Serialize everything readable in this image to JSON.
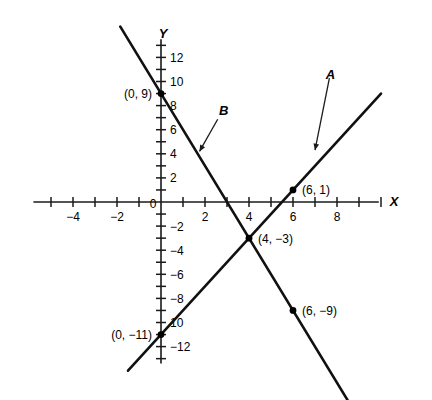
{
  "chart_data": {
    "type": "line",
    "title": "",
    "xlabel": "X",
    "ylabel": "Y",
    "xlim": [
      -5.8,
      10.5
    ],
    "ylim": [
      -13.8,
      14.5
    ],
    "grid": false,
    "legend": "inline-labels",
    "x_ticks": [
      -5,
      -4,
      -3,
      -2,
      -1,
      1,
      2,
      3,
      4,
      5,
      6,
      7,
      8,
      9,
      10
    ],
    "x_tick_labels": [
      {
        "value": -4,
        "text": "−4"
      },
      {
        "value": -2,
        "text": "−2"
      },
      {
        "value": 2,
        "text": "2"
      },
      {
        "value": 4,
        "text": "4"
      },
      {
        "value": 6,
        "text": "6"
      },
      {
        "value": 8,
        "text": "8"
      }
    ],
    "y_ticks": [
      -13,
      -12,
      -11,
      -10,
      -9,
      -8,
      -7,
      -6,
      -5,
      -4,
      -3,
      -2,
      -1,
      1,
      2,
      3,
      4,
      5,
      6,
      7,
      8,
      9,
      10,
      11,
      12,
      13
    ],
    "y_tick_labels": [
      {
        "value": 12,
        "text": "12"
      },
      {
        "value": 10,
        "text": "10"
      },
      {
        "value": 8,
        "text": "8"
      },
      {
        "value": 6,
        "text": "6"
      },
      {
        "value": 4,
        "text": "4"
      },
      {
        "value": 2,
        "text": "2"
      },
      {
        "value": -2,
        "text": "−2"
      },
      {
        "value": -4,
        "text": "−4"
      },
      {
        "value": -6,
        "text": "−6"
      },
      {
        "value": -8,
        "text": "−8"
      },
      {
        "value": -10,
        "text": "10"
      },
      {
        "value": -12,
        "text": "−12"
      }
    ],
    "origin_label": "0",
    "series": [
      {
        "name": "A",
        "slope": 2,
        "intercept": -11,
        "equation": "y = 2x - 11",
        "x_from": -1.5,
        "x_to": 10.0,
        "label_text": "A",
        "label_x": 7.7,
        "label_y": 10.2
      },
      {
        "name": "B",
        "slope": -3,
        "intercept": 9,
        "equation": "y = -3x + 9",
        "x_from": -1.85,
        "x_to": 8.5,
        "label_text": "B",
        "label_x": 2.85,
        "label_y": 7.2
      }
    ],
    "points": [
      {
        "x": 0,
        "y": 9,
        "label": "(0, 9)",
        "label_side": "left",
        "series": "B"
      },
      {
        "x": 6,
        "y": 1,
        "label": "(6, 1)",
        "label_side": "right",
        "series": "A"
      },
      {
        "x": 4,
        "y": -3,
        "label": "(4, −3)",
        "label_side": "right",
        "series": "A,B"
      },
      {
        "x": 6,
        "y": -9,
        "label": "(6, −9)",
        "label_side": "right",
        "series": "B"
      },
      {
        "x": 0,
        "y": -11,
        "label": "(0, −11)",
        "label_side": "left",
        "series": "A"
      }
    ]
  },
  "colors": {
    "axis": "#1a1a1a",
    "line": "#111111",
    "text": "#000000",
    "background": "#ffffff"
  }
}
